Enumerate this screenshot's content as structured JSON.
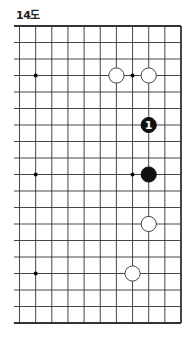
{
  "diagram": {
    "title": "14도",
    "board": {
      "columns": 11,
      "rows": 19,
      "edges": {
        "top": true,
        "bottom": true,
        "right": true,
        "left": false
      },
      "origin_x": 19.5,
      "origin_y": 26,
      "spacing_x": 16.15,
      "spacing_y": 16.5
    },
    "star_points": [
      {
        "col": 1,
        "row": 3
      },
      {
        "col": 7,
        "row": 3
      },
      {
        "col": 1,
        "row": 9
      },
      {
        "col": 7,
        "row": 9
      },
      {
        "col": 1,
        "row": 15
      }
    ],
    "stones": [
      {
        "color": "white",
        "col": 6,
        "row": 3,
        "label": ""
      },
      {
        "color": "white",
        "col": 8,
        "row": 3,
        "label": ""
      },
      {
        "color": "black",
        "col": 8,
        "row": 6,
        "label": "1"
      },
      {
        "color": "black",
        "col": 8,
        "row": 9,
        "label": ""
      },
      {
        "color": "white",
        "col": 8,
        "row": 12,
        "label": ""
      },
      {
        "color": "white",
        "col": 7,
        "row": 15,
        "label": ""
      }
    ],
    "colors": {
      "line": "#333333",
      "black_stone": "#111111",
      "white_stone": "#ffffff",
      "label_on_black": "#ffffff"
    }
  }
}
